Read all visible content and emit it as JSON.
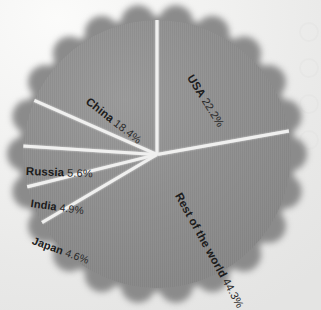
{
  "chart_data": {
    "type": "pie",
    "title": "",
    "unit": "%",
    "categories": [
      "USA",
      "Rest of the world",
      "China",
      "Japan",
      "India",
      "Russia"
    ],
    "values": [
      22.2,
      44.3,
      18.4,
      4.6,
      4.9,
      5.6
    ],
    "slices": [
      {
        "label": "USA",
        "pct_text": "22.2%",
        "value": 22.2,
        "start_angle_deg": -90.0,
        "sweep_deg": 79.9
      },
      {
        "label": "Rest of the world",
        "pct_text": "44.3%",
        "value": 44.3,
        "start_angle_deg": -10.1,
        "sweep_deg": 159.5
      },
      {
        "label": "Japan",
        "pct_text": "4.6%",
        "value": 4.6,
        "start_angle_deg": 149.4,
        "sweep_deg": 16.6
      },
      {
        "label": "India",
        "pct_text": "4.9%",
        "value": 4.9,
        "start_angle_deg": 166.0,
        "sweep_deg": 17.6
      },
      {
        "label": "Russia",
        "pct_text": "5.6%",
        "value": 5.6,
        "start_angle_deg": 183.6,
        "sweep_deg": 20.2
      },
      {
        "label": "China",
        "pct_text": "18.4%",
        "value": 18.4,
        "start_angle_deg": 203.8,
        "sweep_deg": 66.2
      }
    ],
    "legend": "none",
    "grid": false,
    "colors": {
      "slice_fill": "#8d8d8d",
      "separator": "#f0f0ef",
      "label_text": "#1c1c1c",
      "background": "#f1f1f0"
    }
  },
  "labels": {
    "usa": {
      "name": "USA",
      "pct": "22.2%"
    },
    "china": {
      "name": "China",
      "pct": "18.4%"
    },
    "russia": {
      "name": "Russia",
      "pct": "5.6%"
    },
    "india": {
      "name": "India",
      "pct": "4.9%"
    },
    "japan": {
      "name": "Japan",
      "pct": "4.6%"
    },
    "row": {
      "name": "Rest of the world",
      "pct": "44.3%"
    }
  }
}
